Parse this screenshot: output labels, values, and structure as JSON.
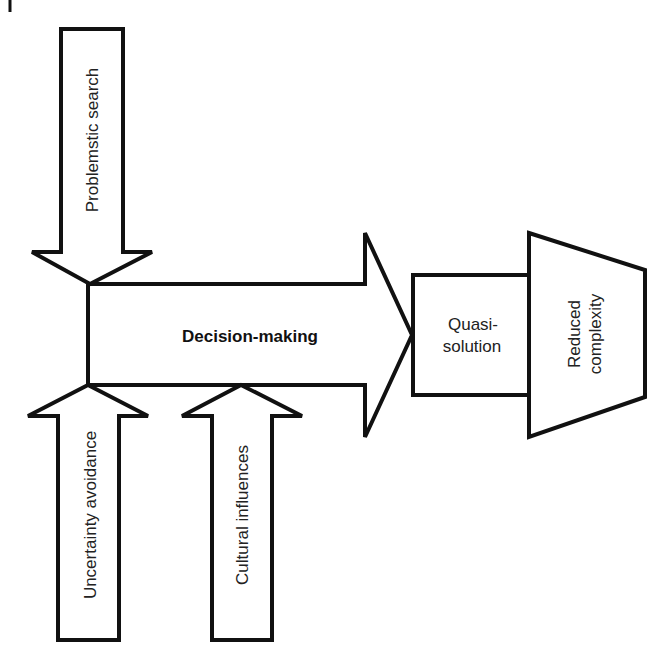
{
  "diagram": {
    "inputs": {
      "top": {
        "label": "Problemstic search"
      },
      "bottom_left": {
        "label": "Uncertainty avoidance"
      },
      "bottom_right": {
        "label": "Cultural influences"
      }
    },
    "process": {
      "label": "Decision-making"
    },
    "output": {
      "line1": "Quasi-",
      "line2": "solution"
    },
    "result": {
      "line1": "Reduced",
      "line2": "complexity"
    },
    "colors": {
      "stroke": "#111111",
      "fill": "#ffffff",
      "text": "#222222"
    }
  }
}
